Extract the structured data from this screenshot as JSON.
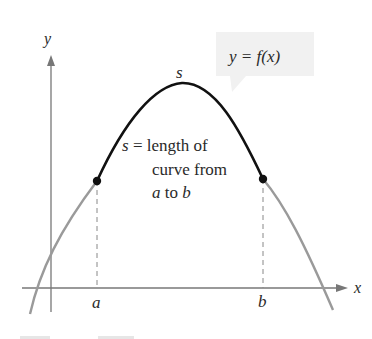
{
  "figure": {
    "axes": {
      "x_label": "x",
      "y_label": "y"
    },
    "curve_label": "y = f(x)",
    "arc_label": "s",
    "annotation": {
      "line1_var": "s",
      "line1_rest": " = length of",
      "line2": "curve from",
      "line3_a": "a",
      "line3_mid": " to ",
      "line3_b": "b"
    },
    "points": {
      "left": "a",
      "right": "b"
    },
    "colors": {
      "highlighted_arc": "#111111",
      "curve": "#9a9a9a",
      "axes": "#777777",
      "label_box": "#f1f1f1"
    }
  }
}
